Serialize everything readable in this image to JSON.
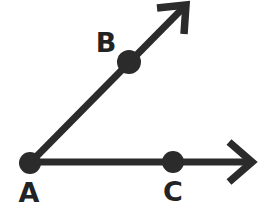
{
  "figure": {
    "background_color": "#ffffff",
    "stroke_color": "#2b2b2b",
    "label_color": "#232323",
    "width": 266,
    "height": 224,
    "points": [
      {
        "id": "A",
        "label": "A",
        "role": "vertex",
        "x": 30,
        "y": 163,
        "radius": 11,
        "label_x": 29,
        "label_y": 202
      },
      {
        "id": "B",
        "label": "B",
        "role": "ray-point",
        "x": 129,
        "y": 62,
        "radius": 12,
        "label_x": 106,
        "label_y": 52
      },
      {
        "id": "C",
        "label": "C",
        "role": "ray-point",
        "x": 173,
        "y": 162,
        "radius": 11,
        "label_x": 173,
        "label_y": 201
      }
    ],
    "rays": [
      {
        "id": "ray-AB",
        "from": "A",
        "through": "B",
        "direction": "up-right",
        "line": "M 30 163 L 184 7",
        "arrow_head": "M 157 8 L 186 5 L 184 34",
        "tip_x": 187,
        "tip_y": 4
      },
      {
        "id": "ray-AC",
        "from": "A",
        "through": "C",
        "direction": "right",
        "line": "M 30 162 L 248 162",
        "arrow_head": "M 229 142 L 252 162 L 229 182",
        "tip_x": 253,
        "tip_y": 162
      }
    ]
  }
}
